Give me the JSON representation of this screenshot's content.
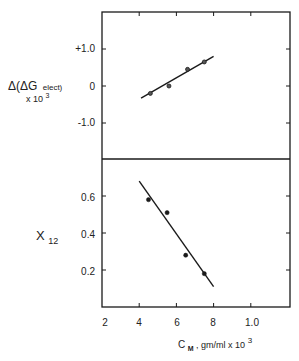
{
  "chart_data": [
    {
      "type": "scatter",
      "panel": "top",
      "ylabel": "Δ(ΔG elect) x 10³",
      "ylabel_parts": {
        "main": "Δ(ΔG",
        "sub": "elect)",
        "line2": "x 10",
        "exp": "3"
      },
      "xlabel": "C_M, gm/ml x 10³",
      "ylim": [
        -2.0,
        2.0
      ],
      "yticks": [
        1.0,
        0,
        -1.0
      ],
      "ytick_labels": [
        "+1.0",
        "0",
        "-1.0"
      ],
      "xlim": [
        2,
        12.2
      ],
      "grid": false,
      "marker": "open-circle",
      "points": [
        {
          "x": 4.6,
          "y": -0.2
        },
        {
          "x": 5.6,
          "y": 0.0
        },
        {
          "x": 6.6,
          "y": 0.45
        },
        {
          "x": 7.5,
          "y": 0.65
        }
      ],
      "fit_line": {
        "x": [
          4.1,
          8.0
        ],
        "y": [
          -0.33,
          0.8
        ]
      }
    },
    {
      "type": "scatter",
      "panel": "bottom",
      "ylabel": "X12",
      "ylabel_parts": {
        "main": "X",
        "sub": "12"
      },
      "xlabel": "C_M, gm/ml x 10³",
      "xlabel_parts": {
        "main": "C",
        "sub": "M",
        "rest": ", gm/ml  x 10",
        "exp": "3"
      },
      "ylim": [
        0,
        0.8
      ],
      "yticks": [
        0.6,
        0.4,
        0.2
      ],
      "ytick_labels": [
        "0.6",
        "0.4",
        "0.2"
      ],
      "xlim": [
        2,
        12.2
      ],
      "xticks": [
        2,
        4,
        6,
        8,
        10
      ],
      "xtick_labels": [
        "2",
        "4",
        "6",
        "8",
        "1.0"
      ],
      "grid": false,
      "marker": "filled-circle",
      "points": [
        {
          "x": 4.5,
          "y": 0.58
        },
        {
          "x": 5.5,
          "y": 0.51
        },
        {
          "x": 6.5,
          "y": 0.28
        },
        {
          "x": 7.5,
          "y": 0.18
        }
      ],
      "fit_line": {
        "x": [
          4.0,
          8.0
        ],
        "y": [
          0.68,
          0.11
        ]
      }
    }
  ],
  "colors": {
    "ink": "#1a1a1a",
    "background": "#ffffff"
  }
}
